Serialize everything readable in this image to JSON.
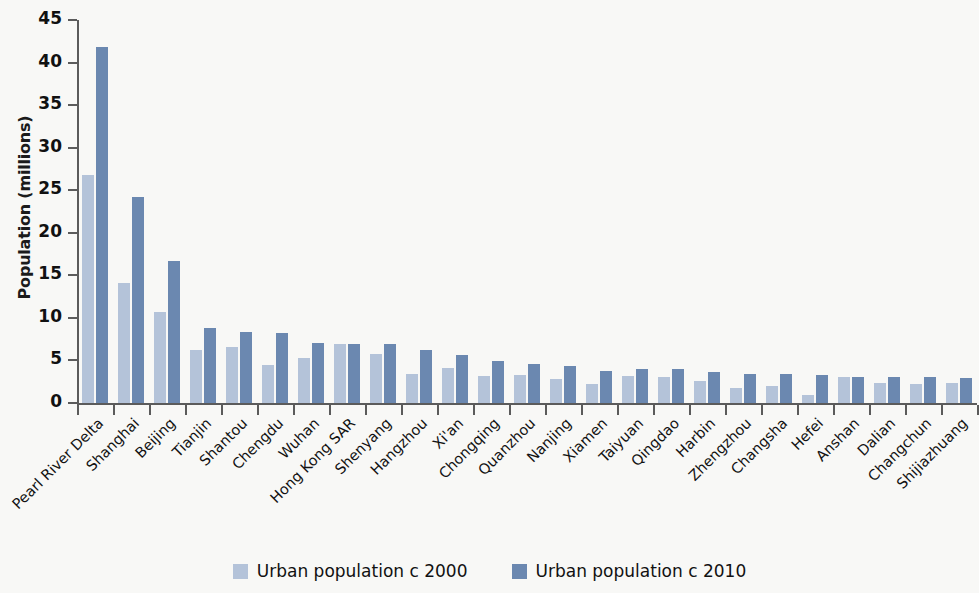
{
  "chart_data": {
    "type": "bar",
    "title": "",
    "xlabel": "",
    "ylabel": "Population (millions)",
    "ylim": [
      0,
      45
    ],
    "ytick_values": [
      0,
      5,
      10,
      15,
      20,
      25,
      30,
      35,
      40,
      45
    ],
    "ytick_labels": [
      "0",
      "5",
      "10",
      "15",
      "20",
      "25",
      "30",
      "35",
      "40",
      "45"
    ],
    "grid": false,
    "legend_position": "bottom-center",
    "categories": [
      "Pearl River Delta",
      "Shanghai",
      "Beijing",
      "Tianjin",
      "Shantou",
      "Chengdu",
      "Wuhan",
      "Hong Kong SAR",
      "Shenyang",
      "Hangzhou",
      "Xi'an",
      "Chongqing",
      "Quanzhou",
      "Nanjing",
      "Xiamen",
      "Taiyuan",
      "Qingdao",
      "Harbin",
      "Zhengzhou",
      "Changsha",
      "Hefei",
      "Anshan",
      "Dalian",
      "Changchun",
      "Shijiazhuang"
    ],
    "series": [
      {
        "name": "Urban population c 2000",
        "color": "#b4c3d9",
        "values": [
          26.8,
          14.1,
          10.7,
          6.2,
          6.6,
          4.5,
          5.3,
          6.9,
          5.8,
          3.4,
          4.1,
          3.2,
          3.3,
          2.8,
          2.2,
          3.2,
          3.1,
          2.6,
          1.8,
          2.0,
          1.0,
          3.0,
          2.4,
          2.2,
          2.3
        ],
        "labels": [
          "Pearl River Delta",
          "Shanghai",
          "Beijing",
          "Tianjin",
          "Shantou",
          "Chengdu",
          "Wuhan",
          "Hong Kong SAR",
          "Shenyang",
          "Hangzhou",
          "Xi'an",
          "Chongqing",
          "Quanzhou",
          "Nanjing",
          "Xiamen",
          "Taiyuan",
          "Qingdao",
          "Harbin",
          "Zhengzhou",
          "Changsha",
          "Hefei",
          "Anshan",
          "Dalian",
          "Changchun",
          "Shijiazhuang"
        ]
      },
      {
        "name": "Urban population c 2010",
        "color": "#6b88b0",
        "values": [
          41.8,
          24.2,
          16.7,
          8.8,
          8.4,
          8.2,
          7.0,
          6.9,
          6.9,
          6.2,
          5.7,
          4.9,
          4.6,
          4.3,
          3.8,
          4.0,
          4.0,
          3.6,
          3.4,
          3.4,
          3.3,
          3.1,
          3.0,
          3.0,
          2.9
        ]
      }
    ]
  },
  "axis": {
    "y_title": "Population (millions)"
  },
  "legend": {
    "items": [
      {
        "label": "Urban population c 2000",
        "color": "#b4c3d9",
        "key": "c2000"
      },
      {
        "label": "Urban population c 2010",
        "color": "#6b88b0",
        "key": "c2010"
      }
    ]
  },
  "colors": {
    "background": "#f8f8f6",
    "axis": "#5b5b5b",
    "text": "#111111",
    "series_2000": "#b4c3d9",
    "series_2010": "#6b88b0"
  }
}
